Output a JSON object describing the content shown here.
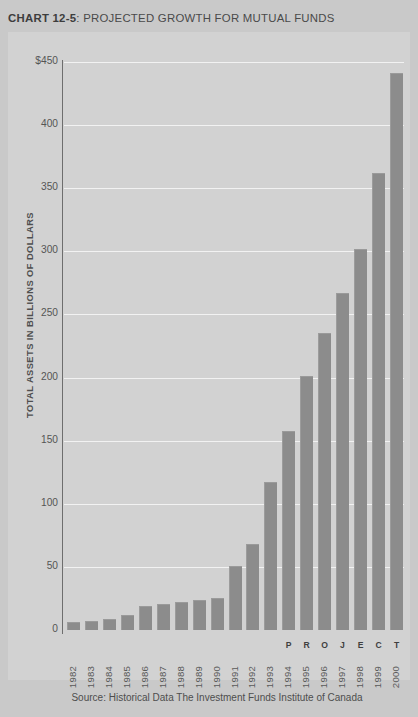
{
  "title": {
    "prefix": "CHART 12-5",
    "rest": ": PROJECTED GROWTH FOR MUTUAL FUNDS",
    "full": "CHART 12-5: PROJECTED GROWTH FOR MUTUAL FUNDS"
  },
  "axis": {
    "ylabel": "TOTAL ASSETS IN BILLIONS OF DOLLARS",
    "yticks": [
      "$450",
      "400",
      "350",
      "300",
      "250",
      "200",
      "150",
      "100",
      "50",
      "0"
    ]
  },
  "projected_label": {
    "text": "PROJECTED",
    "letters": [
      "P",
      "R",
      "O",
      "J",
      "E",
      "C",
      "T",
      "E",
      "D"
    ],
    "start_year": "1994",
    "end_year": "2000"
  },
  "source": "Source: Historical Data The Investment Funds Institute of Canada",
  "colors": {
    "page_background": "#c9c9c9",
    "panel_background": "#d2d2d2",
    "bar": "#8c8c8c",
    "gridline": "#f2f2f2",
    "axis": "#6e6e6e",
    "text": "#4f4f4f"
  },
  "chart_data": {
    "type": "bar",
    "title": "CHART 12-5: PROJECTED GROWTH FOR MUTUAL FUNDS",
    "xlabel": "",
    "ylabel": "TOTAL ASSETS IN BILLIONS OF DOLLARS",
    "ylim": [
      0,
      450
    ],
    "ytick_values": [
      0,
      50,
      100,
      150,
      200,
      250,
      300,
      350,
      400,
      450
    ],
    "grid": true,
    "legend": "none",
    "units": "Billions of dollars",
    "categories": [
      "1982",
      "1983",
      "1984",
      "1985",
      "1986",
      "1987",
      "1988",
      "1989",
      "1990",
      "1991",
      "1992",
      "1993",
      "1994",
      "1995",
      "1996",
      "1997",
      "1998",
      "1999",
      "2000"
    ],
    "values": [
      6,
      7,
      9,
      12,
      19,
      21,
      22,
      24,
      25,
      51,
      68,
      117,
      158,
      201,
      235,
      267,
      302,
      362,
      441
    ],
    "annotations": [
      {
        "text": "PROJECTED",
        "from": "1994",
        "to": "2000"
      }
    ],
    "source": "Source: Historical Data The Investment Funds Institute of Canada"
  }
}
